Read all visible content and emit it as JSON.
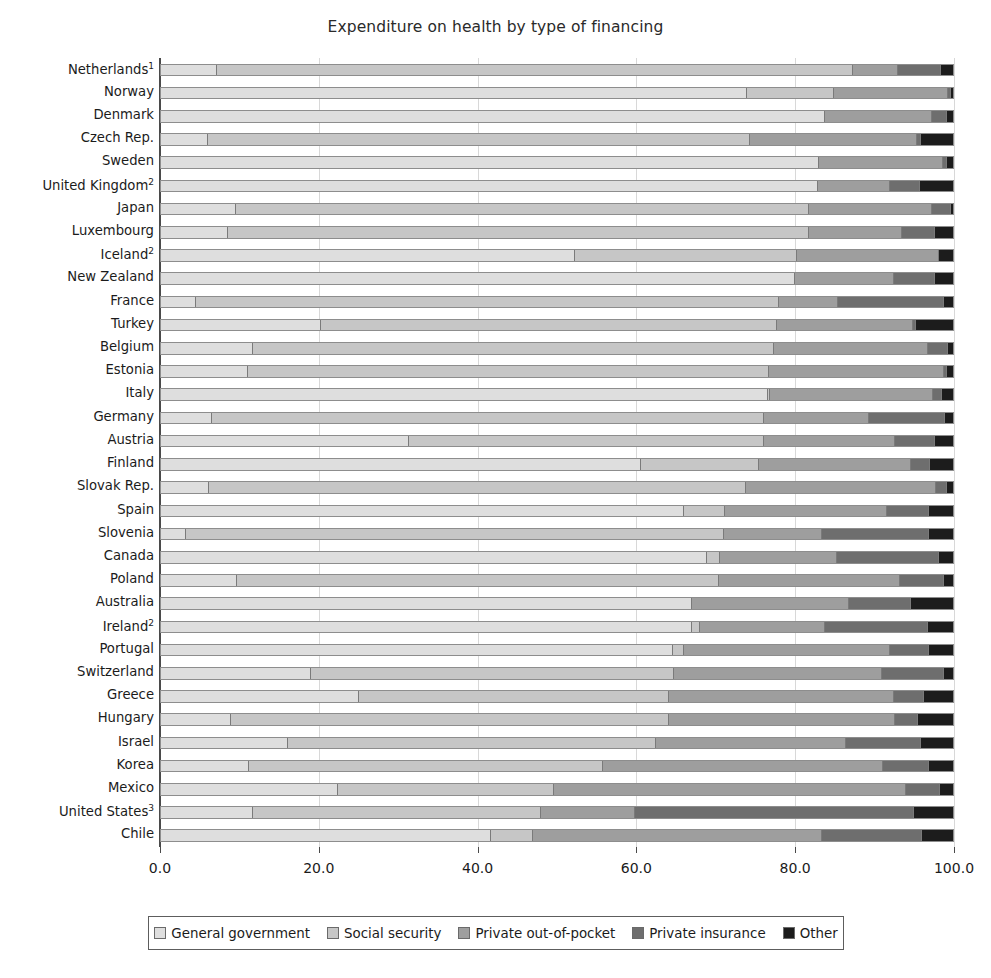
{
  "chart_data": {
    "type": "bar",
    "orientation": "horizontal",
    "stacked": true,
    "title": "Expenditure on health by type of financing",
    "xlabel": "",
    "ylabel": "",
    "xlim": [
      0.0,
      100.0
    ],
    "xticks": [
      "0.0",
      "20.0",
      "40.0",
      "60.0",
      "80.0",
      "100.0"
    ],
    "xtick_values": [
      0,
      20,
      40,
      60,
      80,
      100
    ],
    "grid": "vertical",
    "legend_position": "bottom",
    "series": [
      {
        "name": "General government",
        "color": "#dedede"
      },
      {
        "name": "Social security",
        "color": "#c6c6c6"
      },
      {
        "name": "Private out-of-pocket",
        "color": "#9e9e9e"
      },
      {
        "name": "Private insurance",
        "color": "#6e6e6e"
      },
      {
        "name": "Other",
        "color": "#1c1c1c"
      }
    ],
    "categories": [
      "Netherlands",
      "Norway",
      "Denmark",
      "Czech Rep.",
      "Sweden",
      "United Kingdom",
      "Japan",
      "Luxembourg",
      "Iceland",
      "New Zealand",
      "France",
      "Turkey",
      "Belgium",
      "Estonia",
      "Italy",
      "Germany",
      "Austria",
      "Finland",
      "Slovak Rep.",
      "Spain",
      "Slovenia",
      "Canada",
      "Poland",
      "Australia",
      "Ireland",
      "Portugal",
      "Switzerland",
      "Greece",
      "Hungary",
      "Israel",
      "Korea",
      "Mexico",
      "United States",
      "Chile"
    ],
    "category_footnotes": {
      "Netherlands": "1",
      "United Kingdom": "2",
      "Iceland": "2",
      "Ireland": "2",
      "United States": "3"
    },
    "rows": [
      {
        "label": "Netherlands",
        "footnote": "1",
        "values": [
          7.0,
          80.6,
          5.6,
          5.3,
          1.5
        ]
      },
      {
        "label": "Norway",
        "footnote": "",
        "values": [
          74.2,
          11.0,
          14.3,
          0.3,
          0.2
        ]
      },
      {
        "label": "Denmark",
        "footnote": "",
        "values": [
          84.0,
          0.0,
          13.4,
          1.8,
          0.8
        ]
      },
      {
        "label": "Czech Rep.",
        "footnote": "",
        "values": [
          5.9,
          68.6,
          21.0,
          0.4,
          4.1
        ]
      },
      {
        "label": "Sweden",
        "footnote": "",
        "values": [
          83.3,
          0.0,
          15.6,
          0.4,
          0.7
        ]
      },
      {
        "label": "United Kingdom",
        "footnote": "2",
        "values": [
          83.2,
          0.0,
          9.0,
          3.6,
          4.2
        ]
      },
      {
        "label": "Japan",
        "footnote": "",
        "values": [
          9.4,
          72.6,
          15.5,
          2.2,
          0.3
        ]
      },
      {
        "label": "Luxembourg",
        "footnote": "",
        "values": [
          8.4,
          73.6,
          11.6,
          4.1,
          2.3
        ]
      },
      {
        "label": "Iceland",
        "footnote": "2",
        "values": [
          52.3,
          28.0,
          17.9,
          0.0,
          1.8
        ]
      },
      {
        "label": "New Zealand",
        "footnote": "",
        "values": [
          80.2,
          0.0,
          12.5,
          5.0,
          2.3
        ]
      },
      {
        "label": "France",
        "footnote": "",
        "values": [
          4.3,
          73.9,
          7.3,
          13.4,
          1.1
        ]
      },
      {
        "label": "Turkey",
        "footnote": "",
        "values": [
          20.2,
          57.7,
          17.1,
          0.3,
          4.7
        ]
      },
      {
        "label": "Belgium",
        "footnote": "",
        "values": [
          11.5,
          66.0,
          19.4,
          2.5,
          0.6
        ]
      },
      {
        "label": "Estonia",
        "footnote": "",
        "values": [
          10.9,
          66.0,
          22.1,
          0.3,
          0.7
        ]
      },
      {
        "label": "Italy",
        "footnote": "",
        "values": [
          76.9,
          0.1,
          20.6,
          1.0,
          1.4
        ]
      },
      {
        "label": "Germany",
        "footnote": "",
        "values": [
          6.3,
          70.0,
          13.2,
          9.5,
          1.0
        ]
      },
      {
        "label": "Austria",
        "footnote": "",
        "values": [
          31.3,
          45.0,
          16.5,
          4.9,
          2.3
        ]
      },
      {
        "label": "Finland",
        "footnote": "",
        "values": [
          60.8,
          14.8,
          19.2,
          2.3,
          2.9
        ]
      },
      {
        "label": "Slovak Rep.",
        "footnote": "",
        "values": [
          6.0,
          68.0,
          24.0,
          1.2,
          0.8
        ]
      },
      {
        "label": "Spain",
        "footnote": "",
        "values": [
          66.3,
          5.0,
          20.4,
          5.3,
          3.0
        ]
      },
      {
        "label": "Slovenia",
        "footnote": "",
        "values": [
          3.1,
          68.1,
          12.3,
          13.5,
          3.0
        ]
      },
      {
        "label": "Canada",
        "footnote": "",
        "values": [
          69.2,
          1.5,
          14.7,
          12.8,
          1.8
        ]
      },
      {
        "label": "Poland",
        "footnote": "",
        "values": [
          9.5,
          61.1,
          22.8,
          5.5,
          1.1
        ]
      },
      {
        "label": "Australia",
        "footnote": "",
        "values": [
          67.2,
          0.0,
          19.8,
          7.7,
          5.3
        ]
      },
      {
        "label": "Ireland",
        "footnote": "2",
        "values": [
          67.3,
          0.8,
          15.8,
          12.9,
          3.2
        ]
      },
      {
        "label": "Portugal",
        "footnote": "",
        "values": [
          64.9,
          1.2,
          26.0,
          4.8,
          3.1
        ]
      },
      {
        "label": "Switzerland",
        "footnote": "",
        "values": [
          18.9,
          46.0,
          26.2,
          7.7,
          1.2
        ]
      },
      {
        "label": "Greece",
        "footnote": "",
        "values": [
          25.0,
          39.2,
          28.5,
          3.6,
          3.7
        ]
      },
      {
        "label": "Hungary",
        "footnote": "",
        "values": [
          8.8,
          55.4,
          28.6,
          2.7,
          4.5
        ]
      },
      {
        "label": "Israel",
        "footnote": "",
        "values": [
          16.0,
          46.5,
          24.0,
          9.5,
          4.0
        ]
      },
      {
        "label": "Korea",
        "footnote": "",
        "values": [
          11.0,
          44.9,
          35.4,
          5.6,
          3.1
        ]
      },
      {
        "label": "Mexico",
        "footnote": "",
        "values": [
          22.3,
          27.3,
          44.5,
          4.2,
          1.7
        ]
      },
      {
        "label": "United States",
        "footnote": "3",
        "values": [
          11.6,
          36.4,
          11.8,
          35.3,
          4.9
        ]
      },
      {
        "label": "Chile",
        "footnote": "",
        "values": [
          41.8,
          5.2,
          36.5,
          12.6,
          3.9
        ]
      }
    ]
  },
  "legend": {
    "items": [
      {
        "label": "General government",
        "color": "#dedede"
      },
      {
        "label": "Social security",
        "color": "#c6c6c6"
      },
      {
        "label": "Private out-of-pocket",
        "color": "#9e9e9e"
      },
      {
        "label": "Private insurance",
        "color": "#6e6e6e"
      },
      {
        "label": "Other",
        "color": "#1c1c1c"
      }
    ]
  }
}
